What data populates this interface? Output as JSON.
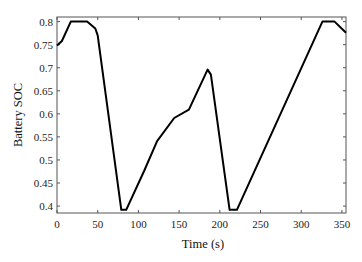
{
  "chart_data": {
    "type": "line",
    "title": "",
    "xlabel": "Time (s)",
    "ylabel": "Battery SOC",
    "xlim": [
      0,
      355
    ],
    "ylim": [
      0.385,
      0.81
    ],
    "grid": false,
    "legend": null,
    "x_ticks": [
      0,
      50,
      100,
      150,
      200,
      250,
      300,
      350
    ],
    "x_tick_labels": [
      "0",
      "50",
      "100",
      "150",
      "200",
      "250",
      "300",
      "350"
    ],
    "y_ticks": [
      0.4,
      0.45,
      0.5,
      0.55,
      0.6,
      0.65,
      0.7,
      0.75,
      0.8
    ],
    "y_tick_labels": [
      "0.4",
      "0.45",
      "0.5",
      "0.55",
      "0.6",
      "0.65",
      "0.7",
      "0.75",
      "0.8"
    ],
    "series": [
      {
        "name": "Battery SOC",
        "color": "#000000",
        "x": [
          0,
          6,
          17,
          37,
          47,
          50,
          79,
          85,
          107,
          123,
          144,
          162,
          185,
          189,
          212,
          221,
          326,
          341,
          355
        ],
        "y": [
          0.748,
          0.758,
          0.8,
          0.8,
          0.785,
          0.77,
          0.392,
          0.392,
          0.476,
          0.541,
          0.591,
          0.609,
          0.696,
          0.685,
          0.392,
          0.392,
          0.8,
          0.8,
          0.776
        ]
      }
    ]
  }
}
